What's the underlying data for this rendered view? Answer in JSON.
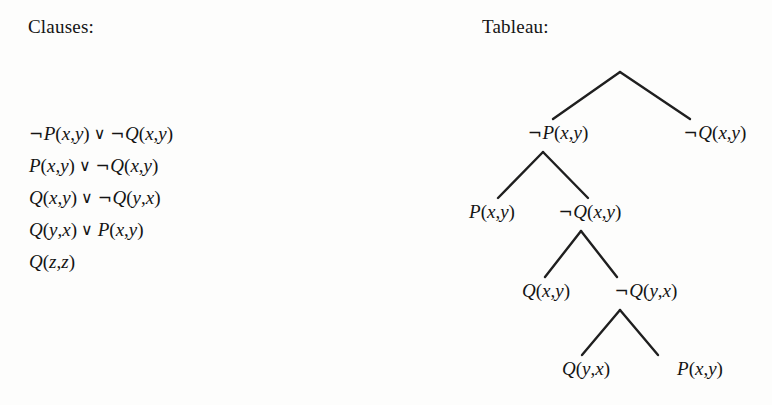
{
  "headings": {
    "clauses": "Clauses:",
    "tableau": "Tableau:"
  },
  "symbols": {
    "negation": "¬",
    "disjunction": "∨"
  },
  "clauses": [
    {
      "id": "clause-1",
      "text": "¬P(x,y) ∨ ¬Q(x,y)",
      "literals": [
        {
          "negated": true,
          "predicate": "P",
          "args": [
            "x",
            "y"
          ]
        },
        {
          "negated": true,
          "predicate": "Q",
          "args": [
            "x",
            "y"
          ]
        }
      ]
    },
    {
      "id": "clause-2",
      "text": "P(x,y) ∨ ¬Q(x,y)",
      "literals": [
        {
          "negated": false,
          "predicate": "P",
          "args": [
            "x",
            "y"
          ]
        },
        {
          "negated": true,
          "predicate": "Q",
          "args": [
            "x",
            "y"
          ]
        }
      ]
    },
    {
      "id": "clause-3",
      "text": "Q(x,y) ∨ ¬Q(y,x)",
      "literals": [
        {
          "negated": false,
          "predicate": "Q",
          "args": [
            "x",
            "y"
          ]
        },
        {
          "negated": true,
          "predicate": "Q",
          "args": [
            "y",
            "x"
          ]
        }
      ]
    },
    {
      "id": "clause-4",
      "text": "Q(y,x) ∨ P(x,y)",
      "literals": [
        {
          "negated": false,
          "predicate": "Q",
          "args": [
            "y",
            "x"
          ]
        },
        {
          "negated": false,
          "predicate": "P",
          "args": [
            "x",
            "y"
          ]
        }
      ]
    },
    {
      "id": "clause-5",
      "text": "Q(z,z)",
      "literals": [
        {
          "negated": false,
          "predicate": "Q",
          "args": [
            "z",
            "z"
          ]
        }
      ]
    }
  ],
  "tableau": {
    "root": {
      "label": "",
      "x": 620,
      "y": 72
    },
    "nodes": [
      {
        "id": "node-l1-left",
        "text": "¬P(x,y)",
        "x": 558,
        "y": 133,
        "negated": true,
        "predicate": "P",
        "args": [
          "x",
          "y"
        ],
        "level": 1
      },
      {
        "id": "node-l1-right",
        "text": "¬Q(x,y)",
        "x": 715,
        "y": 133,
        "negated": true,
        "predicate": "Q",
        "args": [
          "x",
          "y"
        ],
        "level": 1
      },
      {
        "id": "node-l2-left",
        "text": "P(x,y)",
        "x": 492,
        "y": 212,
        "negated": false,
        "predicate": "P",
        "args": [
          "x",
          "y"
        ],
        "level": 2
      },
      {
        "id": "node-l2-right",
        "text": "¬Q(x,y)",
        "x": 590,
        "y": 212,
        "negated": true,
        "predicate": "Q",
        "args": [
          "x",
          "y"
        ],
        "level": 2
      },
      {
        "id": "node-l3-left",
        "text": "Q(x,y)",
        "x": 546,
        "y": 291,
        "negated": false,
        "predicate": "Q",
        "args": [
          "x",
          "y"
        ],
        "level": 3
      },
      {
        "id": "node-l3-right",
        "text": "¬Q(y,x)",
        "x": 646,
        "y": 291,
        "negated": true,
        "predicate": "Q",
        "args": [
          "y",
          "x"
        ],
        "level": 3
      },
      {
        "id": "node-l4-left",
        "text": "Q(y,x)",
        "x": 586,
        "y": 369,
        "negated": false,
        "predicate": "Q",
        "args": [
          "y",
          "x"
        ],
        "level": 4
      },
      {
        "id": "node-l4-right",
        "text": "P(x,y)",
        "x": 700,
        "y": 369,
        "negated": false,
        "predicate": "P",
        "args": [
          "x",
          "y"
        ],
        "level": 4
      }
    ],
    "edges": [
      {
        "id": "edge-root-left",
        "x1": 620,
        "y1": 72,
        "x2": 553,
        "y2": 119
      },
      {
        "id": "edge-root-right",
        "x1": 620,
        "y1": 72,
        "x2": 690,
        "y2": 119
      },
      {
        "id": "edge-l1-left",
        "x1": 543,
        "y1": 152,
        "x2": 498,
        "y2": 198
      },
      {
        "id": "edge-l1-right",
        "x1": 543,
        "y1": 152,
        "x2": 588,
        "y2": 198
      },
      {
        "id": "edge-l2-left",
        "x1": 581,
        "y1": 231,
        "x2": 545,
        "y2": 277
      },
      {
        "id": "edge-l2-right",
        "x1": 581,
        "y1": 231,
        "x2": 617,
        "y2": 277
      },
      {
        "id": "edge-l3-left",
        "x1": 620,
        "y1": 310,
        "x2": 582,
        "y2": 355
      },
      {
        "id": "edge-l3-right",
        "x1": 620,
        "y1": 310,
        "x2": 658,
        "y2": 355
      }
    ],
    "edge_color": "#1f1f1f",
    "edge_width": 2.4
  }
}
